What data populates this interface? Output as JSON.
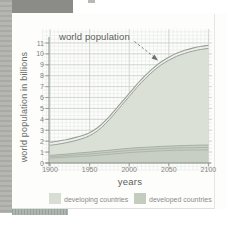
{
  "page": {
    "background_colors": {
      "corner_block": "#8b8b88",
      "left_strip": "#aeaeaa",
      "page": "#fdfdfc",
      "bottom_bar": "#a2aca6"
    }
  },
  "chart_data": {
    "type": "area",
    "annotation": "world population",
    "xlabel": "years",
    "ylabel": "world population in billions",
    "xlim": [
      1900,
      2100
    ],
    "ylim": [
      0,
      11
    ],
    "grid": "graph-paper",
    "x_ticks": [
      "1900",
      "1950",
      "2000",
      "2050",
      "2100"
    ],
    "y_ticks": [
      "0",
      "1",
      "2",
      "3",
      "4",
      "5",
      "6",
      "7",
      "8",
      "9",
      "10",
      "11"
    ],
    "x": [
      1900,
      1910,
      1920,
      1930,
      1940,
      1950,
      1960,
      1970,
      1980,
      1990,
      2000,
      2010,
      2020,
      2030,
      2040,
      2050,
      2060,
      2070,
      2080,
      2090,
      2100
    ],
    "series": [
      {
        "name": "world population",
        "values": [
          1.9,
          2.0,
          2.13,
          2.3,
          2.5,
          2.78,
          3.23,
          3.88,
          4.68,
          5.53,
          6.38,
          7.23,
          8.0,
          8.68,
          9.26,
          9.7,
          10.06,
          10.33,
          10.53,
          10.68,
          10.78
        ]
      },
      {
        "name": "developed countries (upper bound)",
        "values": [
          0.7,
          0.76,
          0.82,
          0.88,
          0.94,
          1.0,
          1.07,
          1.14,
          1.21,
          1.28,
          1.35,
          1.4,
          1.44,
          1.48,
          1.52,
          1.55,
          1.58,
          1.6,
          1.62,
          1.64,
          1.65
        ]
      },
      {
        "name": "developed countries (lower bound)",
        "values": [
          0.45,
          0.49,
          0.53,
          0.57,
          0.61,
          0.65,
          0.71,
          0.77,
          0.83,
          0.89,
          0.95,
          1.0,
          1.04,
          1.08,
          1.12,
          1.15,
          1.17,
          1.18,
          1.19,
          1.2,
          1.2
        ]
      }
    ],
    "legend": [
      {
        "label": "developing countries",
        "color": "#d9ded5"
      },
      {
        "label": "developed countries",
        "color": "#c4ccc0"
      }
    ],
    "colors": {
      "developing_fill": "#dbe0d7",
      "developed_fill": "#c7cec3",
      "band_fill": "#edefe9",
      "curve_stroke": "#999f98",
      "developed_stroke": "#a2a9a1",
      "grid_minor": "#e3e7e1",
      "grid_major": "#c7cdc6",
      "axis": "#8a908a",
      "annotation_arrow": "#6e6e6a"
    }
  }
}
